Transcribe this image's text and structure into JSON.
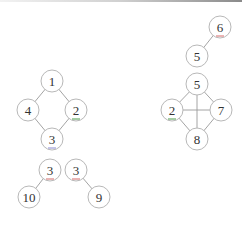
{
  "diagram": {
    "type": "graph-collection",
    "node_radius": 11,
    "colors": {
      "edge": "#9a9a9a",
      "node_stroke": "#b8b8b8",
      "label": "#333333",
      "green_mark": "#4a9a4a",
      "red_mark": "#d46a6a",
      "blue_mark": "#8a8ad0"
    },
    "nodes": [
      {
        "id": "g1_n1",
        "label": "1",
        "x": 52,
        "y": 81
      },
      {
        "id": "g1_n4",
        "label": "4",
        "x": 28,
        "y": 110
      },
      {
        "id": "g1_n2",
        "label": "2",
        "x": 76,
        "y": 110,
        "mark": "green_mark",
        "label_color": "#3a7a3a"
      },
      {
        "id": "g1_n3",
        "label": "3",
        "x": 52,
        "y": 139,
        "mark": "blue_mark"
      },
      {
        "id": "t1_n3",
        "label": "3",
        "x": 50,
        "y": 170,
        "mark": "red_mark"
      },
      {
        "id": "t1_n10",
        "label": "10",
        "x": 29,
        "y": 197
      },
      {
        "id": "t2_n3",
        "label": "3",
        "x": 76,
        "y": 170,
        "mark": "red_mark"
      },
      {
        "id": "t2_n9",
        "label": "9",
        "x": 99,
        "y": 197
      },
      {
        "id": "p_n6",
        "label": "6",
        "x": 220,
        "y": 27,
        "mark": "red_mark"
      },
      {
        "id": "p_n5",
        "label": "5",
        "x": 197,
        "y": 56
      },
      {
        "id": "g2_n5",
        "label": "5",
        "x": 197,
        "y": 84
      },
      {
        "id": "g2_n2",
        "label": "2",
        "x": 172,
        "y": 110,
        "mark": "green_mark",
        "label_color": "#3a7a3a"
      },
      {
        "id": "g2_n7",
        "label": "7",
        "x": 221,
        "y": 110
      },
      {
        "id": "g2_n8",
        "label": "8",
        "x": 197,
        "y": 139
      }
    ],
    "edges": [
      [
        "g1_n1",
        "g1_n4"
      ],
      [
        "g1_n1",
        "g1_n2"
      ],
      [
        "g1_n4",
        "g1_n3"
      ],
      [
        "g1_n2",
        "g1_n3"
      ],
      [
        "t1_n3",
        "t1_n10"
      ],
      [
        "t2_n3",
        "t2_n9"
      ],
      [
        "p_n6",
        "p_n5"
      ],
      [
        "g2_n5",
        "g2_n2"
      ],
      [
        "g2_n5",
        "g2_n7"
      ],
      [
        "g2_n5",
        "g2_n8"
      ],
      [
        "g2_n2",
        "g2_n7"
      ],
      [
        "g2_n2",
        "g2_n8"
      ],
      [
        "g2_n7",
        "g2_n8"
      ]
    ]
  }
}
